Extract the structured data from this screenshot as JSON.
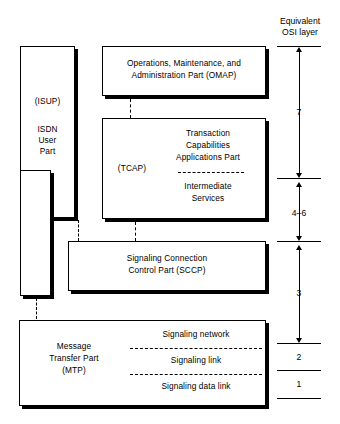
{
  "diagram": {
    "osi_header": {
      "line1": "Equivalent",
      "line2": "OSI layer"
    },
    "blocks": {
      "isup": {
        "name": "ISDN User Part",
        "abbrev": "(ISUP)",
        "line1": "ISDN",
        "line2": "User",
        "line3": "Part"
      },
      "omap": {
        "name": "Operations, Maintenance, and Administration Part",
        "line1": "Operations, Maintenance, and",
        "line2": "Administration Part (OMAP)"
      },
      "tcap": {
        "abbrev": "(TCAP)",
        "line1": "Transaction",
        "line2": "Capabilities",
        "line3": "Applications Part",
        "line4": "Intermediate",
        "line5": "Services"
      },
      "sccp": {
        "line1": "Signaling Connection",
        "line2": "Control Part (SCCP)"
      },
      "mtp": {
        "line1": "Message",
        "line2": "Transfer Part",
        "line3": "(MTP)",
        "sub1": "Signaling network",
        "sub2": "Signaling link",
        "sub3": "Signaling data link"
      }
    },
    "osi_layers": [
      {
        "label": "7"
      },
      {
        "label": "4–6"
      },
      {
        "label": "3"
      },
      {
        "label": "2"
      },
      {
        "label": "1"
      }
    ],
    "colors": {
      "ink": "#000000",
      "paper": "#ffffff"
    }
  }
}
